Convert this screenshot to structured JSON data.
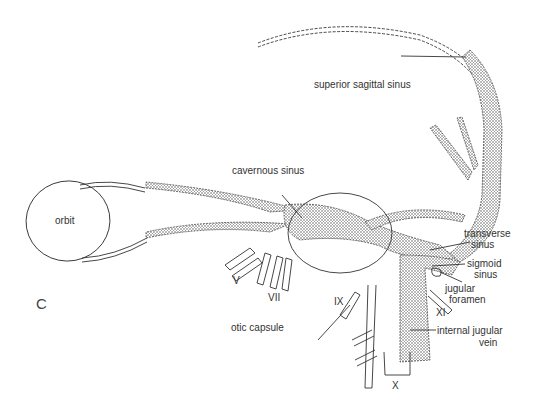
{
  "figure": {
    "panel_letter": "C",
    "colors": {
      "line": "#333333",
      "stipple": "#555555",
      "background": "#ffffff"
    },
    "labels": {
      "superior_sagittal_sinus": "superior sagittal sinus",
      "cavernous_sinus": "cavernous sinus",
      "orbit": "orbit",
      "transverse_sinus_1": "transverse",
      "transverse_sinus_2": "sinus",
      "sigmoid_sinus_1": "sigmoid",
      "sigmoid_sinus_2": "sinus",
      "jugular_foramen_1": "jugular",
      "jugular_foramen_2": "foramen",
      "nerve_XI": "XI",
      "internal_jugular_vein_1": "internal jugular",
      "internal_jugular_vein_2": "vein",
      "nerve_IX": "IX",
      "nerve_X": "X",
      "nerve_V": "V",
      "nerve_VII": "VII",
      "otic_capsule": "otic capsule"
    }
  }
}
